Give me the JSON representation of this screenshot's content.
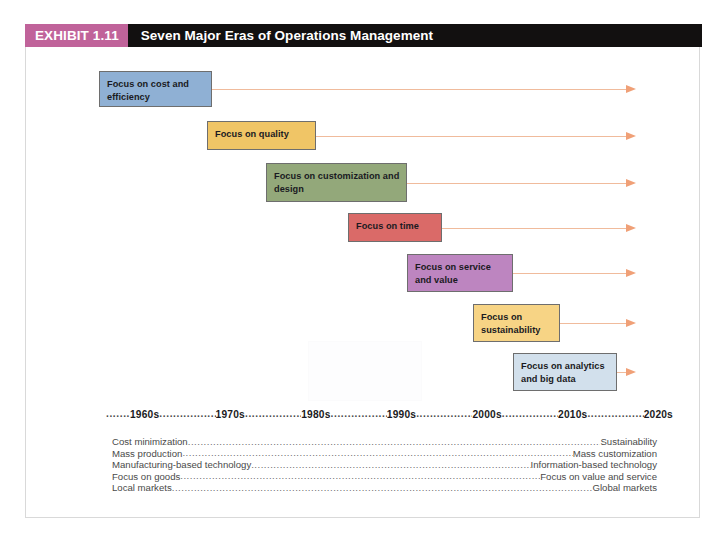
{
  "exhibit": {
    "tag": "EXHIBIT 1.11",
    "title": "Seven Major Eras of Operations Management",
    "tag_color": "#c0639a",
    "title_bar_color": "#121010"
  },
  "eras": [
    {
      "label": "Focus on cost and\nefficiency",
      "color": "#8fb0d4",
      "left": 73,
      "top": 24,
      "width": 113,
      "height": 36,
      "arrow_end": 600
    },
    {
      "label": "Focus on quality",
      "color": "#f0c566",
      "left": 181,
      "top": 74,
      "width": 109,
      "height": 29,
      "arrow_end": 600
    },
    {
      "label": "Focus on customization and\ndesign",
      "color": "#93a87a",
      "left": 240,
      "top": 116,
      "width": 141,
      "height": 39,
      "arrow_end": 600
    },
    {
      "label": "Focus on time",
      "color": "#da6a68",
      "left": 322,
      "top": 166,
      "width": 94,
      "height": 29,
      "arrow_end": 600
    },
    {
      "label": "Focus on service\nand value",
      "color": "#bd85c0",
      "left": 381,
      "top": 207,
      "width": 106,
      "height": 38,
      "arrow_end": 600
    },
    {
      "label": "Focus on\nsustainability",
      "color": "#f7d485",
      "left": 447,
      "top": 257,
      "width": 87,
      "height": 38,
      "arrow_end": 600
    },
    {
      "label": "Focus on analytics\nand big data",
      "color": "#d2e0ec",
      "left": 487,
      "top": 306,
      "width": 104,
      "height": 38,
      "arrow_end": 600
    }
  ],
  "axis": {
    "dot_fill": "..........................................................................................................",
    "lead_dots": "........",
    "decades": [
      "1960s",
      "1970s",
      "1980s",
      "1990s",
      "2000s",
      "2010s",
      "2020s"
    ]
  },
  "contrasts": {
    "dot_fill": "...........................................................................................................................................................................................................................................................",
    "rows": [
      {
        "left": "Cost minimization",
        "right": "Sustainability"
      },
      {
        "left": "Mass production",
        "right": "Mass customization"
      },
      {
        "left": "Manufacturing-based technology",
        "right": "Information-based technology"
      },
      {
        "left": "Focus on goods",
        "right": "Focus on value and service"
      },
      {
        "left": "Local markets",
        "right": "Global markets"
      }
    ]
  },
  "colors": {
    "arrow_line": "#f0bb9c",
    "arrow_head": "#f0a077",
    "box_border": "#6e6e6e",
    "frame_border": "#d9d9d9",
    "text": "#1a1a22",
    "muted_text": "#4a4a4a"
  }
}
